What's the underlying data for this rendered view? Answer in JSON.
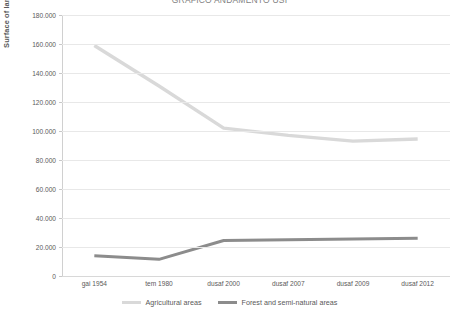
{
  "chart_data": {
    "type": "line",
    "title": "GRAFICO ANDAMENTO USI",
    "xlabel": "",
    "ylabel": "Surface of land use classes (ha)",
    "categories": [
      "gai 1954",
      "tem 1980",
      "dusaf 2000",
      "dusaf 2007",
      "dusaf 2009",
      "dusaf 2012"
    ],
    "ylim": [
      0,
      180000
    ],
    "ytick_values": [
      0,
      20000,
      40000,
      60000,
      80000,
      100000,
      120000,
      140000,
      160000,
      180000
    ],
    "ytick_labels": [
      "0",
      "20.000",
      "40.000",
      "60.000",
      "80.000",
      "100.000",
      "120.000",
      "140.000",
      "160.000",
      "180.000"
    ],
    "grid": "horizontal",
    "legend_position": "bottom",
    "series": [
      {
        "name": "Agricultural areas",
        "color": "#d9d9d9",
        "values": [
          159000,
          131000,
          102000,
          97000,
          93000,
          94500
        ]
      },
      {
        "name": "Forest and semi-natural areas",
        "color": "#8c8c8c",
        "values": [
          14000,
          11500,
          24500,
          25000,
          25500,
          26000
        ]
      }
    ]
  },
  "legend": {
    "items": [
      {
        "label": "Agricultural areas",
        "color": "#d9d9d9"
      },
      {
        "label": "Forest and semi-natural areas",
        "color": "#8c8c8c"
      }
    ]
  },
  "colors": {
    "gridline": "#e8e8e8",
    "axis": "#d0d0d0",
    "text": "#595959",
    "background": "#ffffff"
  }
}
